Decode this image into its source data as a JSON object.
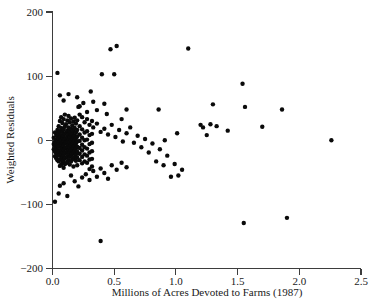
{
  "chart_data": {
    "type": "scatter",
    "title": "",
    "xlabel": "Millions of Acres Devoted to Farms (1987)",
    "ylabel": "Weighted Residuals",
    "xlim": [
      0.0,
      2.5
    ],
    "ylim": [
      -200,
      200
    ],
    "grid": false,
    "legend": null,
    "marker": {
      "shape": "circle",
      "color": "#0a0a0a",
      "size_px": 2.2
    },
    "xticks": [
      0.0,
      0.5,
      1.0,
      1.5,
      2.0,
      2.5
    ],
    "xtick_labels": [
      "0.0",
      "0.5",
      "1.0",
      "1.5",
      "2.0",
      "2.5"
    ],
    "yticks": [
      -200,
      -100,
      0,
      100,
      200
    ],
    "ytick_labels": [
      "-200",
      "-100",
      "0",
      "100",
      "200"
    ],
    "n_points": 260,
    "points": [
      [
        0.04,
        105
      ],
      [
        0.06,
        70
      ],
      [
        0.09,
        62
      ],
      [
        0.13,
        72
      ],
      [
        0.2,
        67
      ],
      [
        0.21,
        52
      ],
      [
        0.22,
        53
      ],
      [
        0.25,
        58
      ],
      [
        0.28,
        44
      ],
      [
        0.31,
        76
      ],
      [
        0.33,
        60
      ],
      [
        0.36,
        47
      ],
      [
        0.4,
        103
      ],
      [
        0.42,
        57
      ],
      [
        0.44,
        41
      ],
      [
        0.47,
        142
      ],
      [
        0.5,
        103
      ],
      [
        0.52,
        147
      ],
      [
        0.56,
        33
      ],
      [
        0.6,
        48
      ],
      [
        0.33,
        20
      ],
      [
        0.36,
        26
      ],
      [
        0.39,
        13
      ],
      [
        0.42,
        18
      ],
      [
        0.45,
        9
      ],
      [
        0.48,
        24
      ],
      [
        0.51,
        5
      ],
      [
        0.54,
        16
      ],
      [
        0.57,
        -2
      ],
      [
        0.6,
        11
      ],
      [
        0.63,
        20
      ],
      [
        0.66,
        -4
      ],
      [
        0.69,
        7
      ],
      [
        0.72,
        -11
      ],
      [
        0.75,
        2
      ],
      [
        0.78,
        -19
      ],
      [
        0.81,
        -5
      ],
      [
        0.84,
        -33
      ],
      [
        0.87,
        -14
      ],
      [
        0.9,
        -39
      ],
      [
        0.93,
        -24
      ],
      [
        0.96,
        -57
      ],
      [
        0.99,
        -37
      ],
      [
        1.02,
        -55
      ],
      [
        1.05,
        -46
      ],
      [
        0.86,
        48
      ],
      [
        0.91,
        0
      ],
      [
        1.01,
        11
      ],
      [
        1.1,
        143
      ],
      [
        1.2,
        24
      ],
      [
        1.22,
        20
      ],
      [
        1.25,
        8
      ],
      [
        1.28,
        25
      ],
      [
        1.3,
        56
      ],
      [
        1.33,
        22
      ],
      [
        1.42,
        15
      ],
      [
        1.54,
        88
      ],
      [
        1.56,
        52
      ],
      [
        1.7,
        21
      ],
      [
        1.86,
        48
      ],
      [
        2.26,
        0
      ],
      [
        1.55,
        -129
      ],
      [
        1.9,
        -121
      ],
      [
        0.39,
        -157
      ],
      [
        0.02,
        -96
      ],
      [
        0.05,
        -83
      ],
      [
        0.06,
        -71
      ],
      [
        0.09,
        -67
      ],
      [
        0.12,
        -87
      ],
      [
        0.15,
        -55
      ],
      [
        0.18,
        -64
      ],
      [
        0.21,
        -72
      ],
      [
        0.24,
        -58
      ],
      [
        0.27,
        -53
      ],
      [
        0.3,
        -62
      ],
      [
        0.33,
        -48
      ],
      [
        0.36,
        -57
      ],
      [
        0.39,
        -44
      ],
      [
        0.42,
        -51
      ],
      [
        0.45,
        -60
      ],
      [
        0.48,
        -39
      ],
      [
        0.52,
        -46
      ],
      [
        0.56,
        -35
      ],
      [
        0.6,
        -42
      ],
      [
        0.01,
        4
      ],
      [
        0.01,
        -6
      ],
      [
        0.01,
        -14
      ],
      [
        0.02,
        12
      ],
      [
        0.02,
        -2
      ],
      [
        0.02,
        -9
      ],
      [
        0.02,
        -18
      ],
      [
        0.02,
        -25
      ],
      [
        0.03,
        8
      ],
      [
        0.03,
        1
      ],
      [
        0.03,
        -5
      ],
      [
        0.03,
        -12
      ],
      [
        0.03,
        -20
      ],
      [
        0.03,
        -28
      ],
      [
        0.04,
        16
      ],
      [
        0.04,
        6
      ],
      [
        0.04,
        -1
      ],
      [
        0.04,
        -8
      ],
      [
        0.04,
        -15
      ],
      [
        0.04,
        -22
      ],
      [
        0.04,
        -31
      ],
      [
        0.05,
        22
      ],
      [
        0.05,
        11
      ],
      [
        0.05,
        3
      ],
      [
        0.05,
        -4
      ],
      [
        0.05,
        -10
      ],
      [
        0.05,
        -17
      ],
      [
        0.05,
        -24
      ],
      [
        0.05,
        -33
      ],
      [
        0.06,
        30
      ],
      [
        0.06,
        14
      ],
      [
        0.06,
        5
      ],
      [
        0.06,
        -2
      ],
      [
        0.06,
        -9
      ],
      [
        0.06,
        -16
      ],
      [
        0.06,
        -23
      ],
      [
        0.06,
        -30
      ],
      [
        0.06,
        -40
      ],
      [
        0.07,
        36
      ],
      [
        0.07,
        19
      ],
      [
        0.07,
        8
      ],
      [
        0.07,
        0
      ],
      [
        0.07,
        -7
      ],
      [
        0.07,
        -14
      ],
      [
        0.07,
        -21
      ],
      [
        0.07,
        -29
      ],
      [
        0.07,
        -38
      ],
      [
        0.08,
        27
      ],
      [
        0.08,
        13
      ],
      [
        0.08,
        4
      ],
      [
        0.08,
        -3
      ],
      [
        0.08,
        -11
      ],
      [
        0.08,
        -19
      ],
      [
        0.08,
        -26
      ],
      [
        0.08,
        -35
      ],
      [
        0.09,
        33
      ],
      [
        0.09,
        17
      ],
      [
        0.09,
        7
      ],
      [
        0.09,
        -1
      ],
      [
        0.09,
        -8
      ],
      [
        0.09,
        -15
      ],
      [
        0.09,
        -23
      ],
      [
        0.09,
        -32
      ],
      [
        0.09,
        -43
      ],
      [
        0.1,
        40
      ],
      [
        0.1,
        21
      ],
      [
        0.1,
        10
      ],
      [
        0.1,
        2
      ],
      [
        0.1,
        -5
      ],
      [
        0.1,
        -13
      ],
      [
        0.1,
        -20
      ],
      [
        0.1,
        -28
      ],
      [
        0.1,
        -37
      ],
      [
        0.11,
        25
      ],
      [
        0.11,
        12
      ],
      [
        0.11,
        3
      ],
      [
        0.11,
        -4
      ],
      [
        0.11,
        -12
      ],
      [
        0.11,
        -19
      ],
      [
        0.11,
        -27
      ],
      [
        0.11,
        -36
      ],
      [
        0.12,
        31
      ],
      [
        0.12,
        15
      ],
      [
        0.12,
        6
      ],
      [
        0.12,
        -2
      ],
      [
        0.12,
        -10
      ],
      [
        0.12,
        -17
      ],
      [
        0.12,
        -25
      ],
      [
        0.12,
        -34
      ],
      [
        0.13,
        38
      ],
      [
        0.13,
        20
      ],
      [
        0.13,
        9
      ],
      [
        0.13,
        1
      ],
      [
        0.13,
        -7
      ],
      [
        0.13,
        -15
      ],
      [
        0.13,
        -22
      ],
      [
        0.13,
        -31
      ],
      [
        0.14,
        28
      ],
      [
        0.14,
        14
      ],
      [
        0.14,
        5
      ],
      [
        0.14,
        -3
      ],
      [
        0.14,
        -11
      ],
      [
        0.14,
        -18
      ],
      [
        0.14,
        -26
      ],
      [
        0.14,
        -38
      ],
      [
        0.15,
        34
      ],
      [
        0.15,
        18
      ],
      [
        0.15,
        8
      ],
      [
        0.15,
        0
      ],
      [
        0.15,
        -8
      ],
      [
        0.15,
        -16
      ],
      [
        0.15,
        -24
      ],
      [
        0.15,
        -33
      ],
      [
        0.16,
        23
      ],
      [
        0.16,
        11
      ],
      [
        0.16,
        2
      ],
      [
        0.16,
        -6
      ],
      [
        0.16,
        -14
      ],
      [
        0.16,
        -21
      ],
      [
        0.16,
        -30
      ],
      [
        0.17,
        29
      ],
      [
        0.17,
        15
      ],
      [
        0.17,
        5
      ],
      [
        0.17,
        -3
      ],
      [
        0.17,
        -11
      ],
      [
        0.17,
        -19
      ],
      [
        0.17,
        -28
      ],
      [
        0.17,
        -41
      ],
      [
        0.18,
        35
      ],
      [
        0.18,
        19
      ],
      [
        0.18,
        7
      ],
      [
        0.18,
        -1
      ],
      [
        0.18,
        -9
      ],
      [
        0.18,
        -17
      ],
      [
        0.18,
        -26
      ],
      [
        0.19,
        26
      ],
      [
        0.19,
        12
      ],
      [
        0.19,
        3
      ],
      [
        0.19,
        -5
      ],
      [
        0.19,
        -13
      ],
      [
        0.19,
        -22
      ],
      [
        0.19,
        -32
      ],
      [
        0.2,
        31
      ],
      [
        0.2,
        16
      ],
      [
        0.2,
        6
      ],
      [
        0.2,
        -2
      ],
      [
        0.2,
        -10
      ],
      [
        0.2,
        -18
      ],
      [
        0.2,
        -27
      ],
      [
        0.2,
        -39
      ],
      [
        0.22,
        40
      ],
      [
        0.22,
        22
      ],
      [
        0.22,
        9
      ],
      [
        0.22,
        -1
      ],
      [
        0.22,
        -12
      ],
      [
        0.22,
        -21
      ],
      [
        0.22,
        -31
      ],
      [
        0.24,
        36
      ],
      [
        0.24,
        17
      ],
      [
        0.24,
        4
      ],
      [
        0.24,
        -7
      ],
      [
        0.24,
        -16
      ],
      [
        0.24,
        -26
      ],
      [
        0.24,
        -36
      ],
      [
        0.26,
        28
      ],
      [
        0.26,
        12
      ],
      [
        0.26,
        0
      ],
      [
        0.26,
        -11
      ],
      [
        0.26,
        -22
      ],
      [
        0.26,
        -33
      ],
      [
        0.28,
        33
      ],
      [
        0.28,
        14
      ],
      [
        0.28,
        1
      ],
      [
        0.28,
        -13
      ],
      [
        0.28,
        -24
      ],
      [
        0.28,
        -35
      ],
      [
        0.3,
        24
      ],
      [
        0.3,
        8
      ],
      [
        0.3,
        -6
      ],
      [
        0.3,
        -19
      ],
      [
        0.3,
        -30
      ],
      [
        0.3,
        -45
      ],
      [
        0.32,
        30
      ],
      [
        0.32,
        10
      ],
      [
        0.32,
        -4
      ],
      [
        0.32,
        -17
      ],
      [
        0.32,
        -29
      ],
      [
        0.32,
        -41
      ]
    ]
  },
  "axes": {
    "xlabel": "Millions of Acres Devoted to Farms (1987)",
    "ylabel": "Weighted Residuals"
  }
}
